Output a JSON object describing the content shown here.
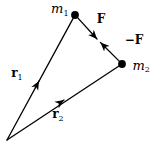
{
  "diagram": {
    "background_color": "#ffffff",
    "ink_color": "#000000",
    "labels": {
      "mass1": {
        "base": "m",
        "sub": "1"
      },
      "mass2": {
        "base": "m",
        "sub": "2"
      },
      "force_on_m1": "F",
      "force_on_m2": "−F",
      "position_vector1": {
        "base": "r",
        "sub": "1"
      },
      "position_vector2": {
        "base": "r",
        "sub": "2"
      }
    }
  }
}
